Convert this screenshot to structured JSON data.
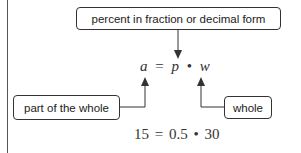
{
  "diagram": {
    "top_label": "percent in fraction or decimal form",
    "left_label": "part of the whole",
    "right_label": "whole",
    "formula": {
      "a": "a",
      "eq": "=",
      "p": "p",
      "dot": "•",
      "w": "w"
    },
    "example": "15 = 0.5 • 30"
  },
  "colors": {
    "stroke": "#333333",
    "text": "#222222"
  }
}
